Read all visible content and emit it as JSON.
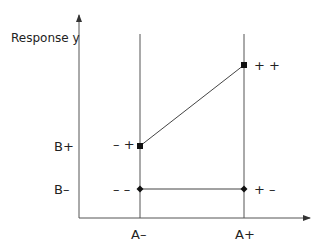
{
  "diagram": {
    "y_axis_label": "Response y",
    "x_ticks": [
      {
        "label": "A–",
        "x": 140
      },
      {
        "label": "A+",
        "x": 244
      }
    ],
    "y_ticks": [
      {
        "label": "B+",
        "y": 146
      },
      {
        "label": "B–",
        "y": 189
      }
    ],
    "points": [
      {
        "name": "minus-minus",
        "label": "– –",
        "x": 140,
        "y": 189,
        "marker": "diamond"
      },
      {
        "name": "plus-minus",
        "label": "+ –",
        "x": 244,
        "y": 189,
        "marker": "diamond"
      },
      {
        "name": "minus-plus",
        "label": "– +",
        "x": 140,
        "y": 146,
        "marker": "square"
      },
      {
        "name": "plus-plus",
        "label": "+ +",
        "x": 244,
        "y": 65,
        "marker": "square"
      }
    ],
    "line_color": "#555555",
    "marker_color": "#111111"
  }
}
